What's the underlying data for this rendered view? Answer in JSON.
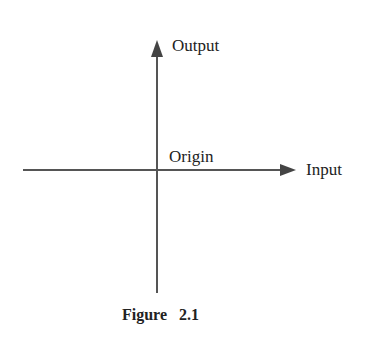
{
  "diagram": {
    "type": "coordinate-axes",
    "axes": {
      "vertical": {
        "label": "Output",
        "direction": "up"
      },
      "horizontal": {
        "label": "Input",
        "direction": "right"
      },
      "intersection": {
        "label": "Origin"
      }
    },
    "caption": "Figure 2.1",
    "colors": {
      "line": "#555555",
      "text": "#222222",
      "background": "#ffffff"
    }
  }
}
